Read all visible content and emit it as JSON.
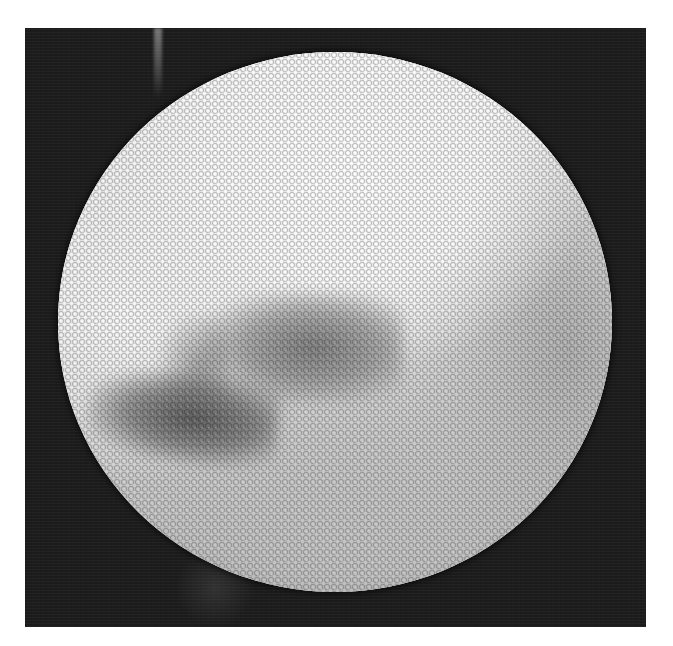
{
  "image": {
    "description": "Grayscale fiberoptic endoscopic view: circular honeycomb-patterned field on a dark background",
    "colors": {
      "background_page": "#ffffff",
      "frame": "#1c1c1c",
      "field_bright": "#ffffff",
      "field_mid": "#cdcdcd",
      "tissue_dark": "#6e6e6e"
    }
  }
}
